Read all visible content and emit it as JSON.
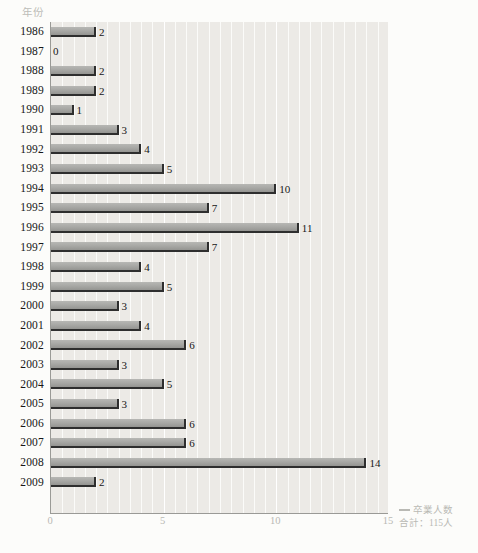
{
  "chart_data": {
    "type": "bar",
    "orientation": "horizontal",
    "title": "",
    "xlabel": "卒業人数",
    "ylabel": "年份",
    "xlim": [
      0,
      15
    ],
    "xticks": [
      0,
      5,
      10,
      15
    ],
    "xtick_labels": [
      "0",
      "5",
      "10",
      "15"
    ],
    "grid": true,
    "grid_axis": "x",
    "legend_position": "bottom-right",
    "categories": [
      "1986",
      "1987",
      "1988",
      "1989",
      "1990",
      "1991",
      "1992",
      "1993",
      "1994",
      "1995",
      "1996",
      "1997",
      "1998",
      "1999",
      "2000",
      "2001",
      "2002",
      "2003",
      "2004",
      "2005",
      "2006",
      "2007",
      "2008",
      "2009"
    ],
    "values": [
      2,
      0,
      2,
      2,
      1,
      3,
      4,
      5,
      10,
      7,
      11,
      7,
      4,
      5,
      3,
      4,
      6,
      3,
      5,
      3,
      6,
      6,
      14,
      2
    ],
    "value_labels": [
      "2",
      "0",
      "2",
      "2",
      "1",
      "3",
      "4",
      "5",
      "10",
      "7",
      "11",
      "7",
      "4",
      "5",
      "3",
      "4",
      "6",
      "3",
      "5",
      "3",
      "6",
      "6",
      "14",
      "2"
    ],
    "series": [
      {
        "name": "卒業人数",
        "values": [
          2,
          0,
          2,
          2,
          1,
          3,
          4,
          5,
          10,
          7,
          11,
          7,
          4,
          5,
          3,
          4,
          6,
          3,
          5,
          3,
          6,
          6,
          14,
          2
        ],
        "color": "#a9a9a6"
      }
    ],
    "annotations": {
      "total_label": "合計：115人",
      "total_value": 115
    }
  },
  "axis": {
    "y_title": "年份",
    "x_title": "卒業人数"
  },
  "legend": {
    "series_label": "卒業人数",
    "total": "合計：115人"
  },
  "colors": {
    "bar_fill": "#a9a9a6",
    "bar_shadow": "#2e2e2e",
    "plot_background": "#eceae6",
    "page_background": "#fcfcfa",
    "gridline": "#fbfbf9",
    "axis_line": "#9a9a96",
    "label_text": "#161616",
    "muted_text": "#b9b9b4"
  }
}
